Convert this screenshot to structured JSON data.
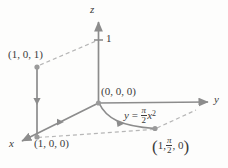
{
  "figure": {
    "kind": "3d-coordinate-axes-diagram",
    "background_color": "#fdfdfc",
    "line_color": "#8c8c8c",
    "text_color": "#3b3b3b"
  },
  "axes": {
    "z_label": "z",
    "y_label": "y",
    "x_label": "x",
    "z_tick_label": "1"
  },
  "points": [
    {
      "name": "point-1-0-1",
      "label": "(1, 0, 1)"
    },
    {
      "name": "origin",
      "label": "(0, 0, 0)"
    },
    {
      "name": "point-1-0-0",
      "label": "(1, 0, 0)"
    }
  ],
  "curve_label": {
    "lhs": "y",
    "equals": "=",
    "frac_num": "π",
    "frac_den": "2",
    "var": "x",
    "exponent": "2"
  },
  "corner_point_label": {
    "open": "(",
    "first": "1,",
    "frac_num": "π",
    "frac_den": "2",
    "last": ", 0",
    "close": ")"
  }
}
